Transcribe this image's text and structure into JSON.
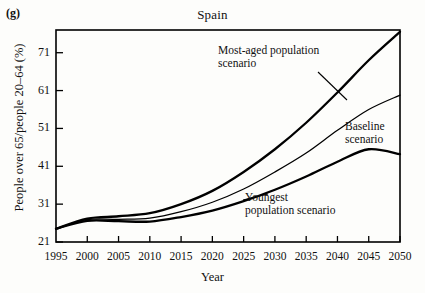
{
  "figure": {
    "panel_label": "(g)",
    "title": "Spain"
  },
  "axes": {
    "xlabel": "Year",
    "ylabel": "People over 65/people 20–64 (%)",
    "xticks": [
      "1995",
      "2000",
      "2005",
      "2010",
      "2015",
      "2020",
      "2025",
      "2030",
      "2035",
      "2040",
      "2045",
      "2050"
    ],
    "yticks": [
      "21",
      "31",
      "41",
      "51",
      "61",
      "71"
    ]
  },
  "annotations": {
    "most_aged_line1": "Most-aged population",
    "most_aged_line2": "scenario",
    "baseline_line1": "Baseline",
    "baseline_line2": "scenario",
    "youngest_line1": "Youngest",
    "youngest_line2": "population scenario"
  },
  "chart_data": {
    "type": "line",
    "title": "Spain",
    "xlabel": "Year",
    "ylabel": "People over 65/people 20-64 (%)",
    "xlim": [
      1995,
      2050
    ],
    "ylim": [
      21,
      77
    ],
    "grid": false,
    "legend": "inline-annotations",
    "x": [
      1995,
      2000,
      2005,
      2010,
      2015,
      2020,
      2025,
      2030,
      2035,
      2040,
      2045,
      2050
    ],
    "series": [
      {
        "name": "Most-aged population scenario",
        "label": "Most-aged population scenario",
        "color": "#000000",
        "values": [
          24.5,
          27.2,
          27.8,
          28.6,
          31.0,
          34.5,
          39.5,
          45.5,
          52.5,
          60.5,
          69.0,
          76.5
        ]
      },
      {
        "name": "Baseline scenario",
        "label": "Baseline scenario",
        "color": "#000000",
        "values": [
          24.5,
          26.9,
          27.0,
          27.3,
          29.0,
          31.5,
          35.0,
          39.5,
          44.5,
          50.5,
          56.0,
          59.8
        ]
      },
      {
        "name": "Youngest population scenario",
        "label": "Youngest population scenario",
        "color": "#000000",
        "values": [
          24.5,
          26.6,
          26.5,
          26.4,
          27.6,
          29.3,
          31.8,
          34.8,
          38.3,
          42.2,
          45.5,
          44.2
        ]
      }
    ]
  },
  "colors": {
    "axis": "#000000",
    "line": "#000000",
    "background": "#fdfdfb"
  }
}
